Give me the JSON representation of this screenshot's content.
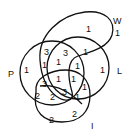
{
  "diagram": {
    "type": "venn",
    "sets": [
      {
        "name": "P",
        "label": "P"
      },
      {
        "name": "W",
        "label": "W"
      },
      {
        "name": "L",
        "label": "L"
      },
      {
        "name": "I",
        "label": "I"
      }
    ],
    "region_values": [
      {
        "id": "w_only",
        "value": "1"
      },
      {
        "id": "w_outside",
        "value": "1"
      },
      {
        "id": "pw_top",
        "value": "3"
      },
      {
        "id": "wl_top",
        "value": "3"
      },
      {
        "id": "wl_right",
        "value": "1"
      },
      {
        "id": "p_only",
        "value": "1"
      },
      {
        "id": "pw_mid",
        "value": "1"
      },
      {
        "id": "pwl_mid",
        "value": "1"
      },
      {
        "id": "wli_small",
        "value": "1"
      },
      {
        "id": "l_only",
        "value": "1"
      },
      {
        "id": "pi_left",
        "value": "3"
      },
      {
        "id": "pwli_center",
        "value": "1"
      },
      {
        "id": "wli_center",
        "value": "1"
      },
      {
        "id": "li_right",
        "value": "1"
      },
      {
        "id": "pi_lower",
        "value": "2"
      },
      {
        "id": "pli_lower",
        "value": "2"
      },
      {
        "id": "pli_center",
        "value": "3"
      },
      {
        "id": "li_lower",
        "value": "1"
      },
      {
        "id": "i_lower",
        "value": "2"
      },
      {
        "id": "i_bottom",
        "value": "2"
      }
    ]
  }
}
